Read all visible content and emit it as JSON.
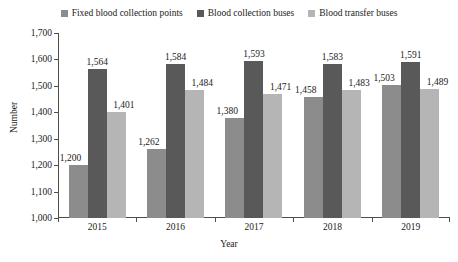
{
  "chart_data": {
    "type": "bar",
    "title": "",
    "xlabel": "Year",
    "ylabel": "Number",
    "categories": [
      "2015",
      "2016",
      "2017",
      "2018",
      "2019"
    ],
    "ylim": [
      1000,
      1700
    ],
    "ytick_labels": [
      "1,000",
      "1,100",
      "1,200",
      "1,300",
      "1,400",
      "1,500",
      "1,600",
      "1,700"
    ],
    "ytick_values": [
      1000,
      1100,
      1200,
      1300,
      1400,
      1500,
      1600,
      1700
    ],
    "grid": false,
    "legend_position": "top-center",
    "series": [
      {
        "name": "Fixed blood collection points",
        "color": "#8c8c8c",
        "values": [
          1200,
          1262,
          1380,
          1458,
          1503
        ],
        "labels": [
          "1,200",
          "1,262",
          "1,380",
          "1,458",
          "1,503"
        ]
      },
      {
        "name": "Blood collection buses",
        "color": "#595959",
        "values": [
          1564,
          1584,
          1593,
          1583,
          1591
        ],
        "labels": [
          "1,564",
          "1,584",
          "1,593",
          "1,583",
          "1,591"
        ]
      },
      {
        "name": "Blood transfer buses",
        "color": "#b5b5b5",
        "values": [
          1401,
          1484,
          1471,
          1483,
          1489
        ],
        "labels": [
          "1,401",
          "1,484",
          "1,471",
          "1,483",
          "1,489"
        ]
      }
    ]
  },
  "legend": {
    "items": [
      {
        "label": "Fixed blood collection points",
        "color": "#8c8c8c",
        "swatch_name": "legend-swatch-fixed-blood-collection-points"
      },
      {
        "label": "Blood collection buses",
        "color": "#595959",
        "swatch_name": "legend-swatch-blood-collection-buses"
      },
      {
        "label": "Blood transfer buses",
        "color": "#b5b5b5",
        "swatch_name": "legend-swatch-blood-transfer-buses"
      }
    ]
  },
  "axes": {
    "x_title": "Year",
    "y_title": "Number"
  }
}
